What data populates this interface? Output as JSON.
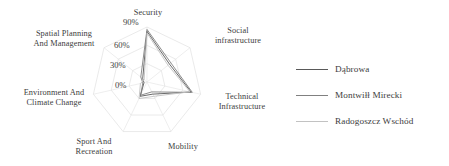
{
  "chart_data": {
    "type": "radar",
    "title": "",
    "categories": [
      "Security",
      "Social infrastructure",
      "Technical Infrastructure",
      "Mobility",
      "Sport And Recreation",
      "Environment And Climate Change",
      "Spatial Planning And Management"
    ],
    "tick_labels": [
      "0%",
      "30%",
      "60%",
      "90%"
    ],
    "tick_values": [
      0,
      30,
      60,
      90
    ],
    "rlim": [
      0,
      90
    ],
    "grid": true,
    "legend_position": "right",
    "series": [
      {
        "name": "Dąbrowa",
        "color": "#595959",
        "values": [
          83,
          47,
          74,
          22,
          26,
          5,
          9
        ]
      },
      {
        "name": "Montwiłł Mirecki",
        "color": "#808080",
        "values": [
          86,
          50,
          76,
          18,
          24,
          7,
          13
        ]
      },
      {
        "name": "Radogoszcz Wschód",
        "color": "#c2c2c2",
        "values": [
          80,
          44,
          72,
          26,
          30,
          11,
          6
        ]
      }
    ]
  },
  "axis_labels": {
    "security": "Security",
    "social_infrastructure": "Social\ninfrastructure",
    "technical_infrastructure": "Technical\nInfrastructure",
    "mobility": "Mobility",
    "sport_and_recreation": "Sport And\nRecreation",
    "environment_and_climate_change": "Environment And\nClimate Change",
    "spatial_planning_and_management": "Spatial Planning\nAnd Management"
  },
  "ticks": {
    "t0": "0%",
    "t30": "30%",
    "t60": "60%",
    "t90": "90%"
  },
  "legend": {
    "items": [
      {
        "label": "Dąbrowa",
        "color": "#595959"
      },
      {
        "label": "Montwiłł Mirecki",
        "color": "#808080"
      },
      {
        "label": "Radogoszcz Wschód",
        "color": "#c2c2c2"
      }
    ]
  }
}
